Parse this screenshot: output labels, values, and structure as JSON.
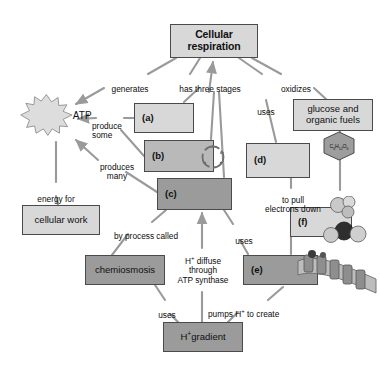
{
  "diagram": {
    "colors": {
      "box_light": "#d8d8d8",
      "box_mid": "#b9b9b9",
      "box_dark": "#9b9b9b",
      "border": "#4a4a4a",
      "edge": "#9a9a9a",
      "text": "#101010",
      "background": "#ffffff"
    },
    "nodes": {
      "cellular_respiration": "Cellular\nrespiration",
      "atp": "ATP",
      "a": "(a)",
      "b": "(b)",
      "c": "(c)",
      "d": "(d)",
      "e": "(e)",
      "f": "(f)",
      "glucose": "glucose and\norganic fuels",
      "cellular_work": "cellular work",
      "chemiosmosis": "chemiosmosis",
      "h_gradient": "H+ gradient",
      "glucose_formula": "C6H12O6"
    },
    "edge_labels": {
      "generates": "generates",
      "has_three_stages": "has three stages",
      "oxidizes": "oxidizes",
      "uses_top": "uses",
      "produce_some": "produce\nsome",
      "produces_many": "produces\nmany",
      "energy_for": "energy for",
      "to_pull_electrons_down": "to pull\nelectrons down",
      "to": "to",
      "by_process_called": "by process called",
      "h_diffuse": "H+ diffuse\nthrough\nATP synthase",
      "uses_mid": "uses",
      "uses_bottom": "uses",
      "pumps_h_to_create": "pumps H+ to create"
    }
  }
}
